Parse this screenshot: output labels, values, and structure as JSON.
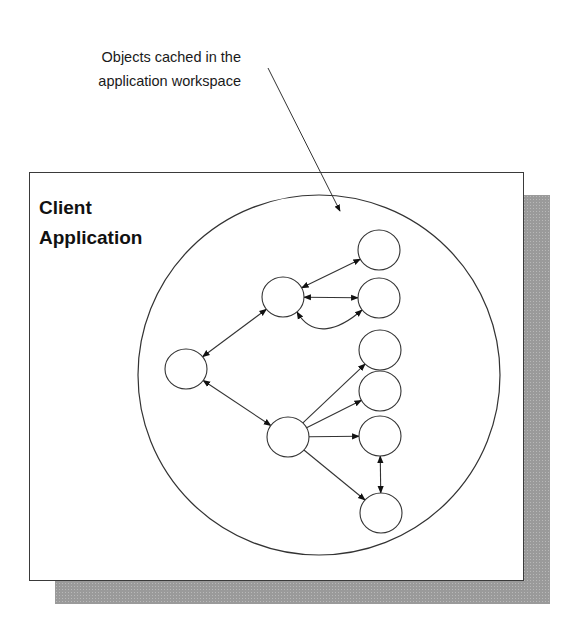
{
  "callout": {
    "line1": "Objects cached in the",
    "line2": "application workspace"
  },
  "container": {
    "title_line1": "Client",
    "title_line2": "Application"
  },
  "colors": {
    "stroke": "#333333",
    "shadow": "#9a9a9a",
    "background": "#ffffff"
  },
  "diagram": {
    "workspace_circle": {
      "cx": 319,
      "cy": 375,
      "rx": 181,
      "ry": 180
    },
    "nodes": [
      {
        "id": "root",
        "cx": 186,
        "cy": 369
      },
      {
        "id": "upper-mid",
        "cx": 283,
        "cy": 297
      },
      {
        "id": "lower-mid",
        "cx": 288,
        "cy": 437
      },
      {
        "id": "r1",
        "cx": 379,
        "cy": 250
      },
      {
        "id": "r2",
        "cx": 379,
        "cy": 298
      },
      {
        "id": "r3",
        "cx": 380,
        "cy": 350
      },
      {
        "id": "r4",
        "cx": 380,
        "cy": 391
      },
      {
        "id": "r5",
        "cx": 380,
        "cy": 436
      },
      {
        "id": "r6",
        "cx": 381,
        "cy": 513
      }
    ],
    "edges": [
      {
        "from": "root",
        "to": "upper-mid",
        "type": "double"
      },
      {
        "from": "root",
        "to": "lower-mid",
        "type": "double"
      },
      {
        "from": "upper-mid",
        "to": "r1",
        "type": "double"
      },
      {
        "from": "upper-mid",
        "to": "r2",
        "type": "double"
      },
      {
        "from": "upper-mid",
        "to": "r2",
        "type": "double-curved"
      },
      {
        "from": "lower-mid",
        "to": "r3",
        "type": "single"
      },
      {
        "from": "lower-mid",
        "to": "r4",
        "type": "single"
      },
      {
        "from": "lower-mid",
        "to": "r5",
        "type": "single"
      },
      {
        "from": "lower-mid",
        "to": "r6",
        "type": "single"
      },
      {
        "from": "r5",
        "to": "r6",
        "type": "double"
      }
    ]
  }
}
